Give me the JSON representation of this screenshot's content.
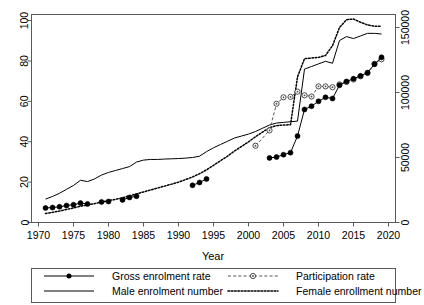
{
  "panel": {
    "label": "B"
  },
  "axes": {
    "x": {
      "title": "Year",
      "ticks": [
        1970,
        1975,
        1980,
        1985,
        1990,
        1995,
        2000,
        2005,
        2010,
        2015,
        2020
      ],
      "tick_labels": [
        "1970",
        "1975",
        "1980",
        "1985",
        "1990",
        "1995",
        "2000",
        "2005",
        "2010",
        "2015",
        "2020"
      ],
      "min": 1969,
      "max": 2021
    },
    "y_left": {
      "title": "",
      "ticks": [
        0,
        20,
        40,
        60,
        80,
        100
      ],
      "tick_labels": [
        "0",
        "20",
        "40",
        "60",
        "80",
        "100"
      ],
      "min": 0,
      "max": 103
    },
    "y_right": {
      "title": "",
      "ticks": [
        0,
        50000,
        100000,
        150000
      ],
      "tick_labels": [
        "0",
        "50000",
        "100000",
        "150000"
      ],
      "min": 0,
      "max": 160000
    }
  },
  "legend": {
    "entries": [
      {
        "label": "Gross enrolment rate",
        "style": "solid-marker",
        "marker": "filled-circle",
        "color": "#000000"
      },
      {
        "label": "Participation rate",
        "style": "dashed-marker",
        "marker": "open-circle",
        "color": "#555555"
      },
      {
        "label": "Male enrolment number",
        "style": "solid",
        "marker": "none",
        "color": "#000000"
      },
      {
        "label": "Female enrollment number",
        "style": "dotted",
        "marker": "none",
        "color": "#000000"
      }
    ]
  },
  "chart_data": {
    "type": "line",
    "title": "",
    "xlabel": "Year",
    "ylabel": "",
    "ylabel_right": "",
    "xlim": [
      1969,
      2021
    ],
    "ylim": [
      0,
      103
    ],
    "ylim_right": [
      0,
      160000
    ],
    "grid": false,
    "legend_position": "bottom",
    "series": [
      {
        "name": "Gross enrolment rate",
        "axis": "left",
        "style": "solid",
        "marker": "filled-circle",
        "color": "#000000",
        "segments": [
          {
            "x": [
              1971,
              1972,
              1973,
              1974,
              1975,
              1976,
              1977
            ],
            "y": [
              7.2,
              7.4,
              7.8,
              8.4,
              8.8,
              9.6,
              9.2
            ]
          },
          {
            "x": [
              1979,
              1980
            ],
            "y": [
              10.2,
              10.4
            ]
          },
          {
            "x": [
              1982,
              1983,
              1984
            ],
            "y": [
              11.2,
              12.4,
              13.0
            ]
          },
          {
            "x": [
              1992,
              1993,
              1994
            ],
            "y": [
              18.4,
              19.8,
              21.6
            ]
          },
          {
            "x": [
              2003,
              2004,
              2005,
              2006,
              2007,
              2008,
              2009,
              2010,
              2011,
              2012,
              2013,
              2014,
              2015,
              2016,
              2017,
              2018,
              2019
            ],
            "y": [
              32.0,
              32.4,
              33.6,
              34.6,
              42.8,
              56.0,
              57.6,
              60.0,
              62.0,
              61.4,
              68.0,
              69.8,
              71.2,
              72.6,
              74.2,
              78.4,
              81.8
            ]
          }
        ]
      },
      {
        "name": "Participation rate",
        "axis": "left",
        "style": "dashed",
        "marker": "open-circle",
        "color": "#555555",
        "segments": [
          {
            "x": [
              2001,
              2003,
              2004,
              2005,
              2006,
              2007,
              2008,
              2009,
              2010,
              2011,
              2012,
              2013,
              2014,
              2015,
              2016,
              2017,
              2018,
              2019
            ],
            "y": [
              38.0,
              45.6,
              58.8,
              62.0,
              62.2,
              64.8,
              63.0,
              62.4,
              67.4,
              67.4,
              67.0,
              68.4,
              69.6,
              70.8,
              72.4,
              74.0,
              78.6,
              80.8
            ]
          }
        ]
      },
      {
        "name": "Male enrolment number",
        "axis": "right",
        "style": "solid",
        "marker": "none",
        "color": "#000000",
        "x": [
          1971,
          1972,
          1973,
          1974,
          1975,
          1976,
          1977,
          1978,
          1979,
          1980,
          1981,
          1982,
          1983,
          1984,
          1985,
          1986,
          1987,
          1988,
          1989,
          1990,
          1991,
          1992,
          1993,
          1994,
          1995,
          1996,
          1997,
          1998,
          1999,
          2000,
          2001,
          2002,
          2003,
          2004,
          2005,
          2006,
          2007,
          2008,
          2009,
          2010,
          2011,
          2012,
          2013,
          2014,
          2015,
          2016,
          2017,
          2018,
          2019
        ],
        "y": [
          18000,
          20000,
          22500,
          25500,
          28500,
          32500,
          31500,
          33500,
          36500,
          38500,
          40000,
          41500,
          43000,
          46500,
          48000,
          48500,
          48500,
          48800,
          49000,
          49200,
          49500,
          50000,
          51000,
          54500,
          57500,
          60000,
          62500,
          65000,
          66500,
          68000,
          70000,
          72500,
          75000,
          76500,
          77000,
          77500,
          78000,
          118000,
          120000,
          122000,
          124000,
          122500,
          140000,
          143000,
          141500,
          143500,
          145500,
          145500,
          145000
        ]
      },
      {
        "name": "Female enrollment number",
        "axis": "right",
        "style": "dotted",
        "marker": "none",
        "color": "#000000",
        "x": [
          1971,
          1972,
          1973,
          1974,
          1975,
          1976,
          1977,
          1978,
          1979,
          1980,
          1981,
          1982,
          1983,
          1984,
          1985,
          1986,
          1987,
          1988,
          1989,
          1990,
          1991,
          1992,
          1993,
          1994,
          1995,
          1996,
          1997,
          1998,
          1999,
          2000,
          2001,
          2002,
          2003,
          2004,
          2005,
          2006,
          2007,
          2008,
          2009,
          2010,
          2011,
          2012,
          2013,
          2014,
          2015,
          2016,
          2017,
          2018,
          2019
        ],
        "y": [
          7000,
          7800,
          8800,
          10000,
          11200,
          12500,
          13500,
          14500,
          15800,
          16800,
          17800,
          19000,
          20500,
          22000,
          23500,
          25000,
          26500,
          28000,
          29500,
          31000,
          33000,
          35000,
          37500,
          40500,
          44000,
          47500,
          51000,
          55000,
          58500,
          62000,
          66000,
          69500,
          73000,
          74500,
          75000,
          75200,
          112000,
          126000,
          126500,
          127000,
          128500,
          136000,
          150000,
          156000,
          156500,
          154000,
          152000,
          151000,
          151000
        ]
      }
    ]
  }
}
